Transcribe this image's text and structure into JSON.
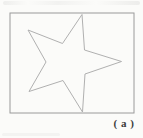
{
  "figure": {
    "label": "( a )"
  },
  "frame": {
    "x": "10",
    "y": "13",
    "w": "124",
    "h": "100"
  },
  "star": {
    "points": "121.5,61.5 84.5,50 82,14.5 62.5,43.5 28,30 46,62 29,91.5 63,80.5 82.5,112 85,74"
  },
  "colors": {
    "background": "#fbfbf9",
    "frame_stroke": "#9a9a9a",
    "star_stroke": "#b0b0b0",
    "label_text": "#3b3b3b"
  }
}
